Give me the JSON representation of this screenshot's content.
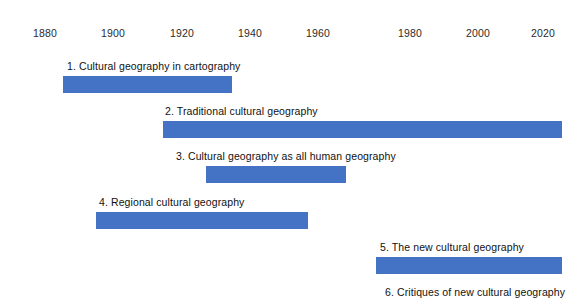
{
  "chart_data": {
    "type": "bar",
    "orientation": "horizontal",
    "subtype": "timeline-gantt",
    "title": "",
    "subtitle": "",
    "xlabel": "",
    "ylabel": "",
    "grid": false,
    "legend": "none",
    "axis": {
      "position": "top",
      "xlim": [
        1875,
        2033
      ],
      "tick_interval": 20,
      "tick_labels": [
        "1880",
        "1900",
        "1920",
        "1940",
        "1960",
        "1980",
        "2000",
        "2020"
      ],
      "tick_values": [
        1880,
        1900,
        1920,
        1940,
        1960,
        1980,
        2000,
        2020
      ],
      "tick_px": [
        45,
        113,
        182,
        250,
        318,
        410,
        478,
        543
      ]
    },
    "bar_color": "#4472C4",
    "label_color": "#111111",
    "background_color": "#FFFFFF",
    "categories": [
      "1. Cultural geography in cartography",
      "2. Traditional cultural geography",
      "3. Cultural geography as all human geography",
      "4. Regional cultural geography",
      "5. The new cultural geography",
      "6. Critiques of new cultural geography"
    ],
    "series": [
      {
        "name": "Period span",
        "items": [
          {
            "label": "1. Cultural geography in cartography",
            "start": 1885,
            "end": 1935,
            "clipped_right": false,
            "bar_visible": true,
            "label_px_left": 67,
            "bar_px_left": 63,
            "bar_px_width": 169,
            "row_px_top": 60
          },
          {
            "label": "2. Traditional cultural geography",
            "start": 1914,
            "end": 2031,
            "clipped_right": true,
            "bar_visible": true,
            "label_px_left": 165,
            "bar_px_left": 163,
            "bar_px_width": 399,
            "row_px_top": 105
          },
          {
            "label": "3. Cultural geography as all human geography",
            "start": 1927,
            "end": 1968,
            "clipped_right": false,
            "bar_visible": true,
            "label_px_left": 176,
            "bar_px_left": 206,
            "bar_px_width": 140,
            "row_px_top": 150
          },
          {
            "label": "4. Regional cultural geography",
            "start": 1895,
            "end": 1957,
            "clipped_right": false,
            "bar_visible": true,
            "label_px_left": 99,
            "bar_px_left": 96,
            "bar_px_width": 212,
            "row_px_top": 196
          },
          {
            "label": "5. The new cultural geography",
            "start": 1977,
            "end": 2031,
            "clipped_right": true,
            "bar_visible": true,
            "label_px_left": 380,
            "bar_px_left": 376,
            "bar_px_width": 186,
            "row_px_top": 241
          },
          {
            "label": "6. Critiques of new cultural geography",
            "start": null,
            "end": null,
            "clipped_right": false,
            "bar_visible": false,
            "label_px_left": 385,
            "bar_px_left": 0,
            "bar_px_width": 0,
            "row_px_top": 286
          }
        ]
      }
    ]
  }
}
